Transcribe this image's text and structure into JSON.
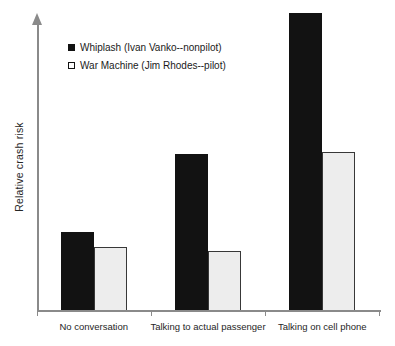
{
  "chart_data": {
    "type": "bar",
    "title": "",
    "categories": [
      "No conversation",
      "Talking to actual passenger",
      "Talking on cell phone"
    ],
    "series": [
      {
        "name": "Whiplash (Ivan Vanko--nonpilot)",
        "values": [
          1.0,
          2.0,
          3.8
        ],
        "fill": "#121212",
        "border": "#121212",
        "swatch": "black"
      },
      {
        "name": "War Machine (Jim Rhodes--pilot)",
        "values": [
          0.81,
          0.76,
          2.02
        ],
        "fill": "#ededed",
        "border": "#383838",
        "swatch": "white"
      }
    ],
    "xlabel": "",
    "ylabel": "Relative crash risk",
    "ylim": [
      0,
      4
    ],
    "y_ticks": [],
    "grid": false,
    "legend_position": "upper-left",
    "axis_color": "#8a8a8a",
    "layout": {
      "baseline_y": 311,
      "px_per_unit": 78.5,
      "bar_width": 33,
      "plot_left": 37,
      "plot_right": 379
    }
  }
}
